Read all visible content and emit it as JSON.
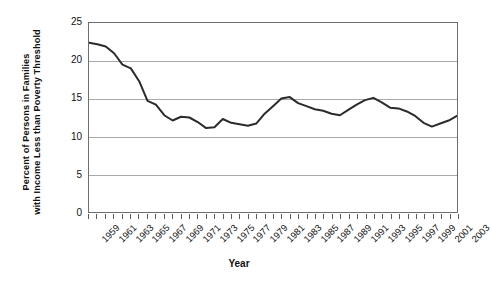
{
  "chart_data": {
    "type": "line",
    "title": "",
    "xlabel": "Year",
    "ylabel": "Percent of Persons in Families with Income Less than Poverty Threshold",
    "ylabel_lines": [
      "Percent of Persons in Families",
      "with Income Less than Poverty Threshold"
    ],
    "ylim": [
      0,
      25
    ],
    "y_ticks": [
      0,
      5,
      10,
      15,
      20,
      25
    ],
    "y_tick_labels": [
      "0",
      "5",
      "10",
      "15",
      "20",
      "25"
    ],
    "xlim": [
      1959,
      2003
    ],
    "grid": "horizontal",
    "legend": "none",
    "line_color": "#2b2b2b",
    "gridline_color": "#a9a9a9",
    "frame_color": "#6e6e6e",
    "x": [
      1959,
      1960,
      1961,
      1962,
      1963,
      1964,
      1965,
      1966,
      1967,
      1968,
      1969,
      1970,
      1971,
      1972,
      1973,
      1974,
      1975,
      1976,
      1977,
      1978,
      1979,
      1980,
      1981,
      1982,
      1983,
      1984,
      1985,
      1986,
      1987,
      1988,
      1989,
      1990,
      1991,
      1992,
      1993,
      1994,
      1995,
      1996,
      1997,
      1998,
      1999,
      2000,
      2001,
      2002,
      2003
    ],
    "values": [
      22.4,
      22.2,
      21.9,
      21.0,
      19.5,
      19.0,
      17.3,
      14.7,
      14.2,
      12.8,
      12.1,
      12.6,
      12.5,
      11.9,
      11.1,
      11.2,
      12.3,
      11.8,
      11.6,
      11.4,
      11.7,
      13.0,
      14.0,
      15.0,
      15.2,
      14.4,
      14.0,
      13.6,
      13.4,
      13.0,
      12.8,
      13.5,
      14.2,
      14.8,
      15.1,
      14.5,
      13.8,
      13.7,
      13.3,
      12.7,
      11.8,
      11.3,
      11.7,
      12.1,
      12.7
    ],
    "x_tick_labels": [
      "1959",
      "1961",
      "1963",
      "1965",
      "1967",
      "1969",
      "1971",
      "1973",
      "1975",
      "1977",
      "1979",
      "1981",
      "1983",
      "1985",
      "1987",
      "1989",
      "1991",
      "1993",
      "1995",
      "1997",
      "1999",
      "2001",
      "2003"
    ]
  }
}
